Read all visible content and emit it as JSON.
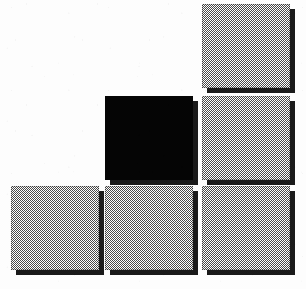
{
  "image": {
    "title": "Square Grid Mark",
    "width": 306,
    "height": 289,
    "background_color": "#fdfdfd",
    "alt_text": "Six squares arranged in a staircase grid, five gray halftone and one solid black"
  },
  "palette": {
    "gray_fill": "#808080",
    "gray_dither_ink": "#4a4a4a",
    "black_fill": "#050505",
    "shadow_color": "#1a1a1a",
    "paper_white": "#fdfdfd"
  },
  "layout": {
    "grid_columns": 3,
    "grid_rows": 3,
    "column_left_px": [
      11,
      105,
      202
    ],
    "row_top_px": [
      4,
      96,
      186
    ],
    "tile_width_px": 88,
    "tile_height_px": 84,
    "shadow_offset_px": 5,
    "empty_cells": [
      "r1c1",
      "r1c2"
    ]
  },
  "tiles": [
    {
      "id": "tile-r1c3",
      "name": "square-top-right",
      "row": 1,
      "column": 3,
      "fill": "gray",
      "x": 202,
      "y": 4,
      "width": 88,
      "height": 84,
      "has_shadow": true
    },
    {
      "id": "tile-r2c2",
      "name": "square-middle-center-black",
      "row": 2,
      "column": 2,
      "fill": "black",
      "x": 105,
      "y": 96,
      "width": 88,
      "height": 84,
      "has_shadow": true
    },
    {
      "id": "tile-r2c3",
      "name": "square-middle-right",
      "row": 2,
      "column": 3,
      "fill": "gray",
      "x": 202,
      "y": 96,
      "width": 88,
      "height": 84,
      "has_shadow": true
    },
    {
      "id": "tile-r3c1",
      "name": "square-bottom-left",
      "row": 3,
      "column": 1,
      "fill": "gray",
      "x": 11,
      "y": 186,
      "width": 88,
      "height": 84,
      "has_shadow": true
    },
    {
      "id": "tile-r3c2",
      "name": "square-bottom-center",
      "row": 3,
      "column": 2,
      "fill": "gray",
      "x": 105,
      "y": 186,
      "width": 88,
      "height": 84,
      "has_shadow": true
    },
    {
      "id": "tile-r3c3",
      "name": "square-bottom-right",
      "row": 3,
      "column": 3,
      "fill": "gray",
      "x": 202,
      "y": 186,
      "width": 88,
      "height": 84,
      "has_shadow": true
    }
  ]
}
